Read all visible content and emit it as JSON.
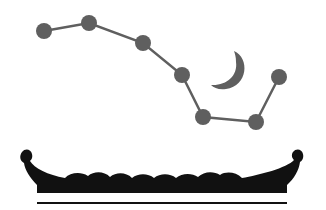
{
  "illustration": {
    "subject": "constellation over boat",
    "colors": {
      "stars": "#5f5f5f",
      "lines": "#5f5f5f",
      "moon": "#5f5f5f",
      "boat": "#111111",
      "ground_line": "#111111",
      "background": "#ffffff"
    },
    "stars": [
      {
        "x": 44,
        "y": 31
      },
      {
        "x": 89,
        "y": 23
      },
      {
        "x": 143,
        "y": 43
      },
      {
        "x": 182,
        "y": 75
      },
      {
        "x": 203,
        "y": 117
      },
      {
        "x": 256,
        "y": 122
      },
      {
        "x": 279,
        "y": 77
      }
    ]
  }
}
